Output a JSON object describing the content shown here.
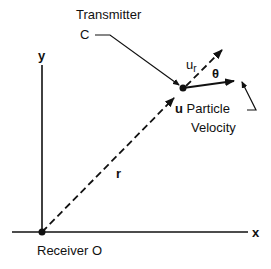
{
  "diagram": {
    "labels": {
      "transmitter": "Transmitter",
      "transmitter_point": "C",
      "y_axis": "y",
      "x_axis": "x",
      "ur_main": "u",
      "ur_sub": "r",
      "theta": "θ",
      "u_bold": "u",
      "particle": " Particle",
      "velocity": "Velocity",
      "r": "r",
      "receiver": "Receiver O"
    },
    "colors": {
      "ink": "#111111",
      "background": "#ffffff"
    }
  }
}
